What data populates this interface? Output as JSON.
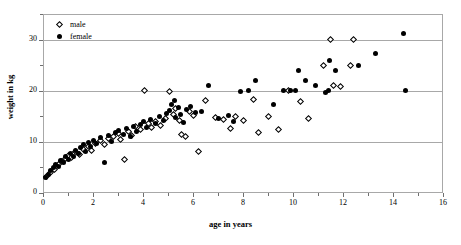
{
  "chart_data": {
    "type": "scatter",
    "title": "",
    "xlabel": "age in years",
    "ylabel": "weight in kg",
    "xlim": [
      0,
      16
    ],
    "ylim": [
      0,
      35
    ],
    "xticks": [
      0,
      2,
      4,
      6,
      8,
      10,
      12,
      14,
      16
    ],
    "xtick_labels": [
      "0",
      "2",
      "4",
      "6",
      "8",
      "10",
      "12",
      "14",
      "16"
    ],
    "xminor_ticks": [
      1,
      3,
      5,
      7,
      9,
      11,
      13,
      15
    ],
    "yticks": [
      0,
      10,
      20,
      30
    ],
    "ytick_labels": [
      "0",
      "10",
      "20",
      "30"
    ],
    "yminor_ticks": [
      5,
      15,
      25,
      35
    ],
    "gridlines": [
      10,
      20,
      30
    ],
    "grid": true,
    "legend_position": "top-left",
    "series": [
      {
        "name": "male",
        "marker": "open-diamond",
        "color": "#000000",
        "points": [
          [
            0.15,
            3.2
          ],
          [
            0.3,
            4.0
          ],
          [
            0.45,
            4.6
          ],
          [
            0.6,
            5.5
          ],
          [
            0.75,
            6.2
          ],
          [
            0.9,
            6.8
          ],
          [
            1.0,
            7.4
          ],
          [
            1.15,
            7.0
          ],
          [
            1.3,
            8.2
          ],
          [
            1.45,
            7.6
          ],
          [
            1.6,
            8.6
          ],
          [
            1.8,
            9.0
          ],
          [
            1.95,
            8.4
          ],
          [
            2.1,
            9.6
          ],
          [
            2.3,
            10.2
          ],
          [
            2.45,
            9.4
          ],
          [
            2.6,
            10.6
          ],
          [
            2.8,
            11.0
          ],
          [
            3.0,
            11.6
          ],
          [
            3.1,
            10.4
          ],
          [
            3.25,
            6.6
          ],
          [
            3.4,
            12.0
          ],
          [
            3.55,
            11.2
          ],
          [
            3.7,
            13.0
          ],
          [
            3.9,
            12.4
          ],
          [
            4.05,
            20.0
          ],
          [
            4.2,
            13.6
          ],
          [
            4.35,
            12.8
          ],
          [
            4.5,
            14.0
          ],
          [
            4.7,
            13.2
          ],
          [
            4.9,
            14.6
          ],
          [
            5.05,
            19.8
          ],
          [
            5.2,
            15.4
          ],
          [
            5.3,
            16.6
          ],
          [
            5.45,
            14.2
          ],
          [
            5.55,
            11.4
          ],
          [
            5.7,
            11.0
          ],
          [
            5.85,
            16.0
          ],
          [
            6.0,
            15.2
          ],
          [
            6.2,
            8.2
          ],
          [
            6.5,
            18.0
          ],
          [
            6.9,
            14.8
          ],
          [
            7.2,
            14.4
          ],
          [
            7.5,
            12.6
          ],
          [
            7.7,
            15.0
          ],
          [
            8.0,
            14.2
          ],
          [
            8.4,
            18.2
          ],
          [
            8.6,
            11.8
          ],
          [
            9.0,
            15.0
          ],
          [
            9.4,
            12.4
          ],
          [
            9.8,
            20.0
          ],
          [
            10.3,
            17.8
          ],
          [
            10.6,
            14.6
          ],
          [
            11.2,
            25.0
          ],
          [
            11.5,
            30.0
          ],
          [
            11.6,
            21.0
          ],
          [
            11.9,
            20.8
          ],
          [
            12.3,
            25.0
          ],
          [
            12.4,
            30.0
          ]
        ]
      },
      {
        "name": "female",
        "marker": "filled-circle",
        "color": "#000000",
        "points": [
          [
            0.1,
            3.0
          ],
          [
            0.2,
            3.6
          ],
          [
            0.3,
            4.4
          ],
          [
            0.4,
            5.0
          ],
          [
            0.5,
            5.6
          ],
          [
            0.6,
            5.2
          ],
          [
            0.7,
            6.4
          ],
          [
            0.8,
            6.0
          ],
          [
            0.9,
            7.2
          ],
          [
            1.0,
            6.6
          ],
          [
            1.1,
            7.8
          ],
          [
            1.2,
            7.2
          ],
          [
            1.3,
            8.4
          ],
          [
            1.4,
            7.8
          ],
          [
            1.5,
            8.8
          ],
          [
            1.6,
            9.4
          ],
          [
            1.7,
            8.2
          ],
          [
            1.8,
            9.8
          ],
          [
            1.9,
            9.0
          ],
          [
            2.0,
            10.2
          ],
          [
            2.15,
            9.6
          ],
          [
            2.3,
            10.8
          ],
          [
            2.45,
            6.0
          ],
          [
            2.6,
            11.2
          ],
          [
            2.75,
            10.0
          ],
          [
            2.9,
            11.8
          ],
          [
            3.0,
            12.2
          ],
          [
            3.2,
            11.4
          ],
          [
            3.35,
            12.6
          ],
          [
            3.5,
            11.0
          ],
          [
            3.6,
            13.0
          ],
          [
            3.75,
            12.0
          ],
          [
            3.9,
            13.4
          ],
          [
            4.0,
            14.0
          ],
          [
            4.15,
            12.8
          ],
          [
            4.3,
            14.4
          ],
          [
            4.5,
            13.6
          ],
          [
            4.65,
            15.0
          ],
          [
            4.8,
            14.2
          ],
          [
            4.95,
            15.6
          ],
          [
            5.05,
            16.2
          ],
          [
            5.15,
            17.4
          ],
          [
            5.25,
            18.0
          ],
          [
            5.3,
            14.8
          ],
          [
            5.4,
            16.8
          ],
          [
            5.5,
            15.4
          ],
          [
            5.6,
            13.8
          ],
          [
            5.75,
            16.4
          ],
          [
            5.9,
            17.0
          ],
          [
            6.1,
            15.8
          ],
          [
            6.35,
            16.0
          ],
          [
            6.6,
            21.0
          ],
          [
            7.0,
            14.6
          ],
          [
            7.4,
            15.2
          ],
          [
            7.6,
            14.0
          ],
          [
            7.9,
            19.8
          ],
          [
            8.2,
            20.0
          ],
          [
            8.5,
            22.0
          ],
          [
            9.2,
            17.4
          ],
          [
            9.6,
            20.0
          ],
          [
            9.9,
            20.0
          ],
          [
            10.1,
            20.0
          ],
          [
            10.2,
            24.0
          ],
          [
            10.5,
            22.0
          ],
          [
            10.9,
            21.0
          ],
          [
            11.3,
            19.6
          ],
          [
            11.4,
            20.0
          ],
          [
            11.45,
            26.0
          ],
          [
            11.7,
            24.0
          ],
          [
            12.6,
            25.0
          ],
          [
            13.3,
            27.2
          ],
          [
            14.4,
            31.2
          ],
          [
            14.5,
            20.0
          ]
        ]
      }
    ]
  },
  "legend": {
    "entries": [
      {
        "label": "male",
        "marker": "open-diamond"
      },
      {
        "label": "female",
        "marker": "filled-circle"
      }
    ]
  },
  "axes": {
    "x_title": "age in years",
    "y_title": "weight in kg"
  }
}
